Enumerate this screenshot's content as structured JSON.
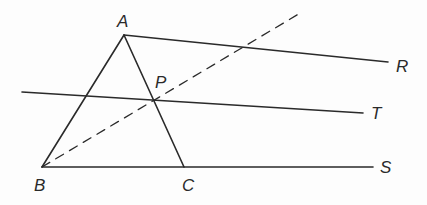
{
  "diagram": {
    "points": {
      "A": {
        "label": "A",
        "x": 124,
        "y": 35,
        "lx": 117,
        "ly": 27
      },
      "B": {
        "label": "B",
        "x": 42,
        "y": 167,
        "lx": 34,
        "ly": 191
      },
      "C": {
        "label": "C",
        "x": 184,
        "y": 167,
        "lx": 182,
        "ly": 191
      },
      "P": {
        "label": "P",
        "x": 154,
        "y": 100,
        "lx": 155,
        "ly": 88
      },
      "R": {
        "label": "R",
        "x": 388,
        "y": 62,
        "lx": 396,
        "ly": 72
      },
      "T": {
        "label": "T",
        "x": 363,
        "y": 113,
        "lx": 371,
        "ly": 119
      },
      "S": {
        "label": "S",
        "x": 373,
        "y": 167,
        "lx": 380,
        "ly": 173
      }
    },
    "segments": [
      {
        "name": "AB",
        "from": [
          124,
          35
        ],
        "to": [
          42,
          167
        ],
        "style": "solid"
      },
      {
        "name": "AC",
        "from": [
          124,
          35
        ],
        "to": [
          184,
          167
        ],
        "style": "solid"
      },
      {
        "name": "AR",
        "from": [
          124,
          35
        ],
        "to": [
          388,
          62
        ],
        "style": "solid"
      },
      {
        "name": "BS",
        "from": [
          42,
          167
        ],
        "to": [
          373,
          167
        ],
        "style": "solid"
      },
      {
        "name": "line-T",
        "from": [
          22,
          92
        ],
        "to": [
          363,
          113
        ],
        "style": "solid"
      },
      {
        "name": "BP-extended",
        "from": [
          42,
          167
        ],
        "to": [
          302,
          12
        ],
        "style": "dashed"
      }
    ],
    "stroke_color": "#2a2a2a"
  }
}
